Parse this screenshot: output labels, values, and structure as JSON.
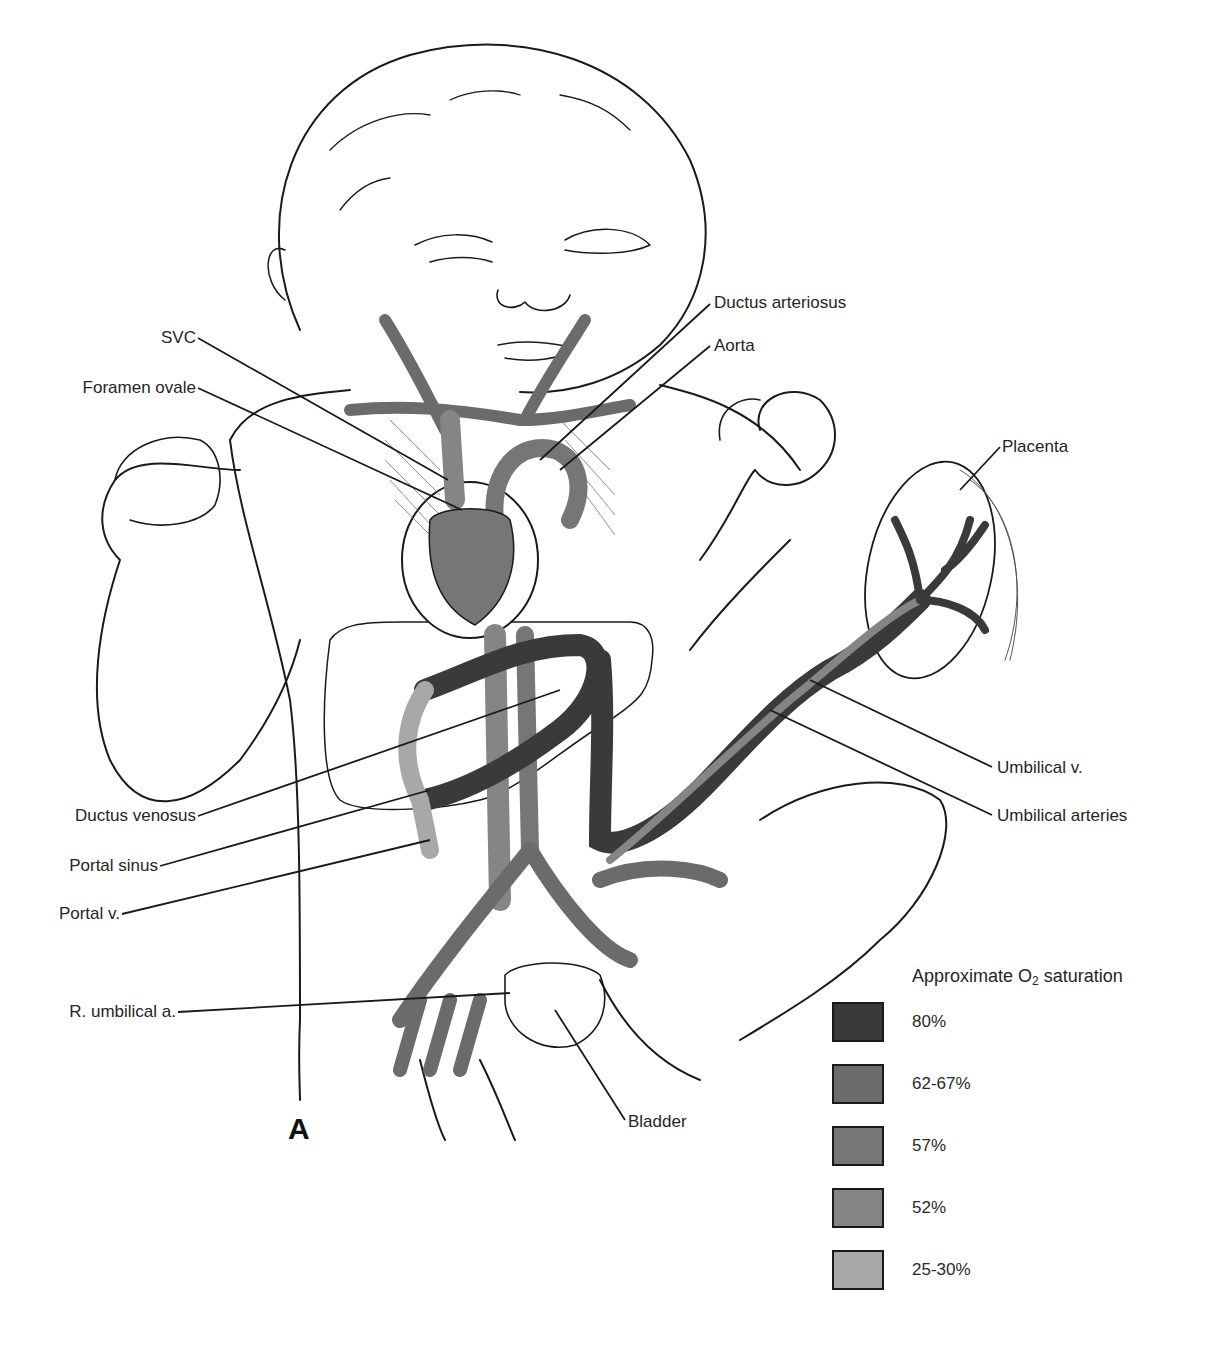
{
  "figure": {
    "panel_letter": "A"
  },
  "labels": {
    "svc": "SVC",
    "foramen_ovale": "Foramen ovale",
    "ductus_arteriosus": "Ductus arteriosus",
    "aorta": "Aorta",
    "placenta": "Placenta",
    "umbilical_v": "Umbilical v.",
    "umbilical_arteries": "Umbilical arteries",
    "ductus_venosus": "Ductus venosus",
    "portal_sinus": "Portal sinus",
    "portal_v": "Portal v.",
    "r_umbilical_a": "R. umbilical a.",
    "bladder": "Bladder"
  },
  "legend": {
    "title_prefix": "Approximate O",
    "title_sub": "2",
    "title_suffix": " saturation",
    "items": [
      {
        "label": "80%",
        "color": "#3a3a3a"
      },
      {
        "label": "62-67%",
        "color": "#6b6b6b"
      },
      {
        "label": "57%",
        "color": "#767676"
      },
      {
        "label": "52%",
        "color": "#858585"
      },
      {
        "label": "25-30%",
        "color": "#a8a8a8"
      }
    ]
  },
  "colors": {
    "line": "#1a1a1a",
    "vessel_80": "#3a3a3a",
    "vessel_62_67": "#6b6b6b",
    "vessel_57": "#767676",
    "vessel_52": "#858585",
    "vessel_25_30": "#a8a8a8",
    "background": "#ffffff"
  }
}
